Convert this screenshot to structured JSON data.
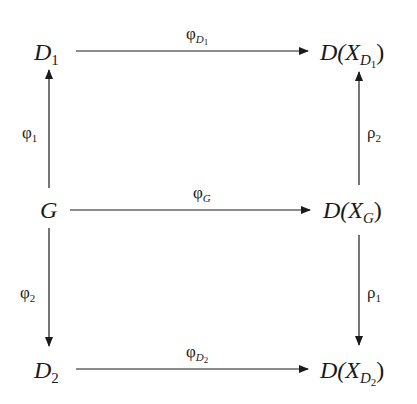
{
  "diagram": {
    "type": "commutative-diagram",
    "nodes": {
      "D1": {
        "base": "D",
        "sub": "1"
      },
      "D2": {
        "base": "D",
        "sub": "2"
      },
      "G": {
        "base": "G"
      },
      "DXD1": {
        "prefix": "D(",
        "var": "X",
        "sub": "D",
        "subsub": "1",
        "suffix": ")"
      },
      "DXG": {
        "prefix": "D(",
        "var": "X",
        "sub": "G",
        "suffix": ")"
      },
      "DXD2": {
        "prefix": "D(",
        "var": "X",
        "sub": "D",
        "subsub": "2",
        "suffix": ")"
      }
    },
    "arrows": [
      {
        "from": "D1",
        "to": "DXD1",
        "label": {
          "base": "φ",
          "sub": "D",
          "subsub": "1"
        }
      },
      {
        "from": "G",
        "to": "DXG",
        "label": {
          "base": "φ",
          "sub": "G"
        }
      },
      {
        "from": "D2",
        "to": "DXD2",
        "label": {
          "base": "φ",
          "sub": "D",
          "subsub": "2"
        }
      },
      {
        "from": "G",
        "to": "D1",
        "label": {
          "base": "φ",
          "sub": "1"
        }
      },
      {
        "from": "G",
        "to": "D2",
        "label": {
          "base": "φ",
          "sub": "2"
        }
      },
      {
        "from": "DXG",
        "to": "DXD1",
        "label": {
          "base": "ρ",
          "sub": "2"
        }
      },
      {
        "from": "DXG",
        "to": "DXD2",
        "label": {
          "base": "ρ",
          "sub": "1"
        }
      }
    ],
    "colors": {
      "stroke": "#1a1a1a",
      "background": "#ffffff"
    }
  }
}
